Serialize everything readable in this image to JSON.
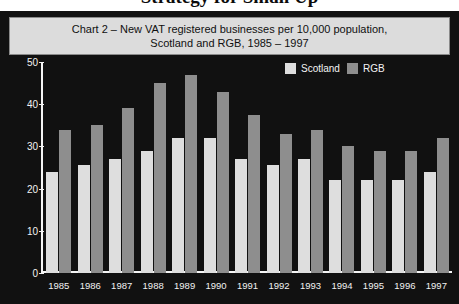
{
  "page": {
    "cropped_heading_above": "Strategy for Small Up"
  },
  "chart_panel": {
    "background_color": "#111111",
    "title_box_color": "#dcdcdc"
  },
  "title": {
    "line1": "Chart 2 – New VAT registered businesses per 10,000 population,",
    "line2": "Scotland and RGB, 1985 – 1997"
  },
  "legend": {
    "position": "top-right",
    "entries": [
      {
        "label": "Scotland",
        "color": "#dedede"
      },
      {
        "label": "RGB",
        "color": "#8e8e8e"
      }
    ]
  },
  "chart_data": {
    "type": "bar",
    "title": "Chart 2 – New VAT registered businesses per 10,000 population, Scotland and RGB, 1985 – 1997",
    "xlabel": "",
    "ylabel": "",
    "ylim": [
      0,
      50
    ],
    "yticks": [
      0,
      10,
      20,
      30,
      40,
      50
    ],
    "ytick_labels": [
      "0",
      "10",
      "20",
      "30",
      "40",
      "50"
    ],
    "grid": false,
    "legend_position": "top-right",
    "categories": [
      "1985",
      "1986",
      "1987",
      "1988",
      "1989",
      "1990",
      "1991",
      "1992",
      "1993",
      "1994",
      "1995",
      "1996",
      "1997"
    ],
    "series": [
      {
        "name": "Scotland",
        "color": "#dedede",
        "values": [
          24,
          25.5,
          27,
          29,
          32,
          32,
          27,
          25.5,
          27,
          22,
          22,
          22,
          24
        ]
      },
      {
        "name": "RGB",
        "color": "#8e8e8e",
        "values": [
          34,
          35,
          39,
          45,
          47,
          43,
          37.5,
          33,
          34,
          30,
          29,
          29,
          32
        ]
      }
    ]
  }
}
